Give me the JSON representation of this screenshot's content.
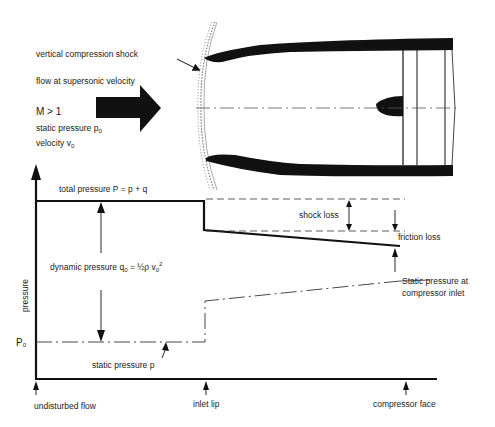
{
  "intake": {
    "labels": {
      "shock": "vertical compression shock",
      "flow": "flow at supersonic velocity",
      "mach": "M > 1",
      "static_pressure": "static pressure p",
      "static_pressure_sub": "0",
      "velocity": "velocity v",
      "velocity_sub": "0"
    }
  },
  "graph": {
    "y_axis_label": "pressure",
    "p0_label": "P",
    "p0_sub": "0",
    "total_pressure": "total pressure P = p + q",
    "dynamic_pressure": "dynamic pressure q",
    "dynamic_pressure_sub": "0",
    "dynamic_pressure_eq": " = ½ρ v",
    "dynamic_pressure_sub2": "0",
    "dynamic_pressure_sup": "2",
    "shock_loss": "shock loss",
    "friction_loss": "friction loss",
    "static_at_compressor_1": "Static pressure at",
    "static_at_compressor_2": "compressor inlet",
    "static_pressure_p": "static pressure p",
    "x_labels": {
      "undisturbed": "undisturbed flow",
      "inlet_lip": "inlet lip",
      "compressor_face": "compressor face"
    }
  },
  "colors": {
    "ink": "#111111",
    "background": "#ffffff"
  }
}
